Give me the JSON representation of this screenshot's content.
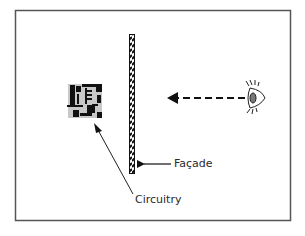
{
  "diagram": {
    "labels": {
      "facade": "Façade",
      "circuitry": "Circuitry"
    },
    "elements": [
      {
        "name": "circuitry",
        "description": "circuit board chip graphic"
      },
      {
        "name": "facade",
        "description": "vertical hatched wall"
      },
      {
        "name": "eye",
        "description": "observer eye looking left"
      },
      {
        "name": "gaze-arrow",
        "description": "dashed arrow from eye toward facade"
      }
    ],
    "colors": {
      "frame": "#555555",
      "ink": "#111111",
      "chip_background": "#c8c8c8"
    }
  }
}
